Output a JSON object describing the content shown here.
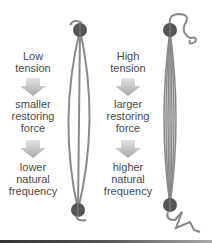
{
  "left_panel": {
    "title_line1": "Low",
    "title_line2": "tension",
    "step1_line1": "smaller",
    "step1_line2": "restoring",
    "step1_line3": "force",
    "step2_line1": "lower",
    "step2_line2": "natural",
    "step2_line3": "frequency"
  },
  "right_panel": {
    "title_line1": "High",
    "title_line2": "tension",
    "step1_line1": "larger",
    "step1_line2": "restoring",
    "step1_line3": "force",
    "step2_line1": "higher",
    "step2_line2": "natural",
    "step2_line3": "frequency"
  },
  "colors": {
    "string": "#8a8a8a",
    "anchor_ball": "#555555",
    "text": "#4a4a4a",
    "arrow": "#bdbdbd"
  }
}
